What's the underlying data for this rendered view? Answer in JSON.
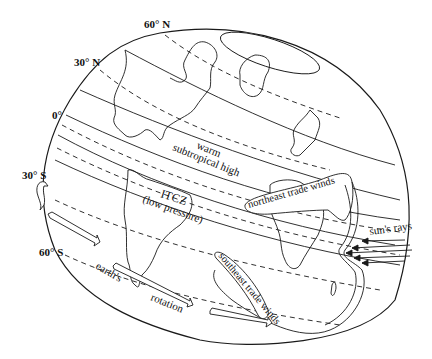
{
  "diagram": {
    "type": "atmospheric-circulation-globe",
    "latitude_labels": {
      "n60": "60° N",
      "n30": "30° N",
      "eq": "0°",
      "s30": "30° S",
      "s60": "60° S"
    },
    "zones": {
      "subtropical_high_line1": "warm",
      "subtropical_high_line2": "subtropical high",
      "itcz_line1": "ITCZ",
      "itcz_line2": "(low pressure)"
    },
    "winds": {
      "northeast": "northeast trade winds",
      "southeast": "southeast trade winds"
    },
    "rotation": {
      "word1": "earth's",
      "word2": "rotation"
    },
    "sun": {
      "label": "sun's rays"
    },
    "colors": {
      "line": "#1a1a1a",
      "background": "#ffffff"
    }
  }
}
